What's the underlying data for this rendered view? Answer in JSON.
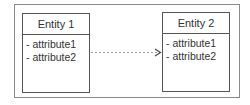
{
  "diagram": {
    "entities": [
      {
        "name": "Entity 1",
        "attributes": [
          "- attribute1",
          "- attribute2"
        ]
      },
      {
        "name": "Entity 2",
        "attributes": [
          "- attribute1",
          "- attribute2"
        ]
      }
    ],
    "connector": {
      "from": "Entity 1",
      "to": "Entity 2",
      "style": "dashed",
      "arrowhead": "open",
      "color": "#999999"
    }
  }
}
